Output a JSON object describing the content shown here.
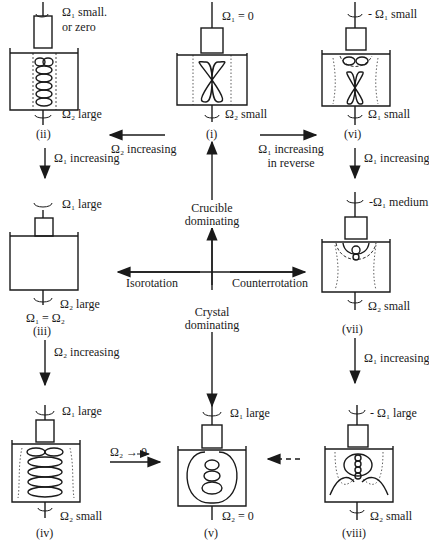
{
  "axes": {
    "top": [
      "Crucible",
      "dominating"
    ],
    "bottom": [
      "Crystal",
      "dominating"
    ],
    "left": "Isorotation",
    "right": "Counterrotation"
  },
  "panels": [
    {
      "id": "i",
      "label": "(i)",
      "top": "Ω₁ = 0",
      "top2": "",
      "bottom": "Ω₂ small"
    },
    {
      "id": "ii",
      "label": "(ii)",
      "top": "Ω₁ small.",
      "top2": "or zero",
      "bottom": "Ω₂ large"
    },
    {
      "id": "iii",
      "label": "(iii)",
      "top": "Ω₁ large",
      "top2": "",
      "bottom": "Ω₂ large",
      "extra": "Ω₁ = Ω₂"
    },
    {
      "id": "iv",
      "label": "(iv)",
      "top": "Ω₁ large",
      "top2": "",
      "bottom": "Ω₂ small"
    },
    {
      "id": "v",
      "label": "(v)",
      "top": "Ω₁ large",
      "top2": "",
      "bottom": "Ω₂ = 0"
    },
    {
      "id": "vi",
      "label": "(vi)",
      "top": "- Ω₁ small",
      "top2": "",
      "bottom": "Ω₁ small"
    },
    {
      "id": "vii",
      "label": "(vii)",
      "top": "-Ω₁ medium",
      "top2": "",
      "bottom": "Ω₂ small"
    },
    {
      "id": "viii",
      "label": "(viii)",
      "top": "- Ω₁ large",
      "top2": "",
      "bottom": "Ω₂ small"
    }
  ],
  "transitions": {
    "i_to_ii": "Ω₂ increasing",
    "i_to_vi": [
      "Ω₁ increasing",
      "in reverse"
    ],
    "ii_to_iii": "Ω₁ increasing",
    "iii_to_iv": "Ω₂ increasing",
    "vi_to_vii": "Ω₁ increasing",
    "vii_to_viii": "Ω₁ increasing",
    "iv_to_v": "Ω₂ → 0"
  }
}
